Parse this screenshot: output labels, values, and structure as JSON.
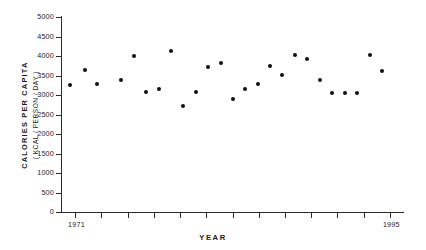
{
  "chart_data": {
    "type": "scatter",
    "title": "",
    "xlabel": "YEAR",
    "ylabel": "CALORIES  PER  CAPITA",
    "ylabel_sub": "( KCAL / PERSON / DAY )",
    "xlim": [
      1970,
      1996
    ],
    "ylim": [
      0,
      5000
    ],
    "grid": false,
    "legend": null,
    "ytick_labels": [
      "5000",
      "4500",
      "4000",
      "3500",
      "3000",
      "2500",
      "2000",
      "1500",
      "1000",
      "500",
      "0"
    ],
    "ytick_values": [
      5000,
      4500,
      4000,
      3500,
      3000,
      2500,
      2000,
      1500,
      1000,
      500,
      0
    ],
    "xtick_values": [
      1971,
      1973,
      1975,
      1977,
      1979,
      1981,
      1983,
      1985,
      1987,
      1989,
      1991,
      1993,
      1995
    ],
    "xtick_labels": [
      "1971",
      "",
      "",
      "",
      "",
      "",
      "",
      "",
      "",
      "",
      "",
      "",
      "1995"
    ],
    "x": [
      1971,
      1972,
      1973,
      1974,
      1975,
      1976,
      1977,
      1978,
      1979,
      1980,
      1981,
      1982,
      1983,
      1984,
      1985,
      1986,
      1987,
      1988,
      1989,
      1990,
      1991,
      1992,
      1993,
      1994,
      1995
    ],
    "values": [
      3400,
      3790,
      3430,
      3530,
      4150,
      3220,
      3290,
      4270,
      2860,
      3230,
      3870,
      3980,
      3050,
      3290,
      3440,
      3880,
      3660,
      4180,
      4080,
      3540,
      3190,
      3180,
      3190,
      4170,
      3760
    ],
    "series": [
      {
        "name": "Calories per capita",
        "values": [
          3400,
          3790,
          3430,
          3530,
          4150,
          3220,
          3290,
          4270,
          2860,
          3230,
          3870,
          3980,
          3050,
          3290,
          3440,
          3880,
          3660,
          4180,
          4080,
          3540,
          3190,
          3180,
          3190,
          4170,
          3760
        ]
      }
    ],
    "marker": "filled-circle",
    "marker_color": "#111111",
    "points": [
      {
        "x": 1971,
        "y": 3400,
        "px": 70,
        "py": 85
      },
      {
        "x": 1972,
        "y": 3790,
        "px": 85,
        "py": 70
      },
      {
        "x": 1973,
        "y": 3430,
        "px": 97,
        "py": 84
      },
      {
        "x": 1974,
        "y": 3530,
        "px": 121,
        "py": 80
      },
      {
        "x": 1975,
        "y": 4150,
        "px": 134,
        "py": 56
      },
      {
        "x": 1976,
        "y": 3220,
        "px": 146,
        "py": 92
      },
      {
        "x": 1977,
        "y": 3290,
        "px": 159,
        "py": 89
      },
      {
        "x": 1978,
        "y": 4270,
        "px": 171,
        "py": 51
      },
      {
        "x": 1979,
        "y": 2860,
        "px": 183,
        "py": 106
      },
      {
        "x": 1980,
        "y": 3230,
        "px": 196,
        "py": 92
      },
      {
        "x": 1981,
        "y": 3870,
        "px": 208,
        "py": 67
      },
      {
        "x": 1982,
        "y": 3980,
        "px": 221,
        "py": 63
      },
      {
        "x": 1983,
        "y": 3050,
        "px": 233,
        "py": 99
      },
      {
        "x": 1984,
        "y": 3290,
        "px": 245,
        "py": 89
      },
      {
        "x": 1985,
        "y": 3440,
        "px": 258,
        "py": 84
      },
      {
        "x": 1986,
        "y": 3880,
        "px": 270,
        "py": 66
      },
      {
        "x": 1987,
        "y": 3660,
        "px": 282,
        "py": 75
      },
      {
        "x": 1988,
        "y": 4180,
        "px": 295,
        "py": 55
      },
      {
        "x": 1989,
        "y": 4080,
        "px": 307,
        "py": 59
      },
      {
        "x": 1990,
        "y": 3540,
        "px": 320,
        "py": 80
      },
      {
        "x": 1991,
        "y": 3190,
        "px": 332,
        "py": 93
      },
      {
        "x": 1992,
        "y": 3180,
        "px": 345,
        "py": 93
      },
      {
        "x": 1993,
        "y": 3190,
        "px": 357,
        "py": 93
      },
      {
        "x": 1994,
        "y": 4170,
        "px": 370,
        "py": 55
      },
      {
        "x": 1995,
        "y": 3760,
        "px": 382,
        "py": 71
      }
    ]
  },
  "colors": {
    "axis": "#2b2b2b",
    "marker": "#111111",
    "text": "#1a1a1a",
    "background": "#ffffff"
  }
}
